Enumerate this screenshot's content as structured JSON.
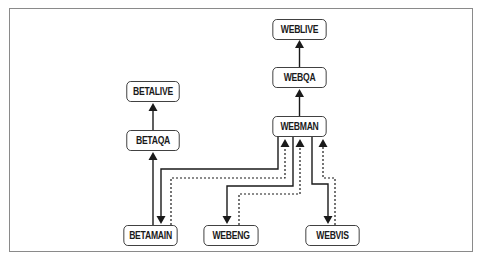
{
  "diagram": {
    "type": "branch-promotion-flow",
    "nodes": {
      "weblive": {
        "label": "WEBLIVE",
        "x": 268,
        "y": 19,
        "w": 63,
        "h": 21
      },
      "webqa": {
        "label": "WEBQA",
        "x": 268,
        "y": 67,
        "w": 63,
        "h": 21
      },
      "webman": {
        "label": "WEBMAN",
        "x": 268,
        "y": 116,
        "w": 63,
        "h": 21
      },
      "betalive": {
        "label": "BETALIVE",
        "x": 122,
        "y": 81,
        "w": 62,
        "h": 21
      },
      "betaqa": {
        "label": "BETAQA",
        "x": 122,
        "y": 130,
        "w": 62,
        "h": 21
      },
      "betamain": {
        "label": "BETAMAIN",
        "x": 119,
        "y": 225,
        "w": 63,
        "h": 21
      },
      "webeng": {
        "label": "WEBENG",
        "x": 199,
        "y": 225,
        "w": 64,
        "h": 21
      },
      "webvis": {
        "label": "WEBVIS",
        "x": 301,
        "y": 225,
        "w": 63,
        "h": 21
      }
    },
    "edges": [
      {
        "from": "WEBQA",
        "to": "WEBLIVE",
        "style": "solid"
      },
      {
        "from": "WEBMAN",
        "to": "WEBQA",
        "style": "solid"
      },
      {
        "from": "BETAQA",
        "to": "BETALIVE",
        "style": "solid"
      },
      {
        "from": "BETAMAIN",
        "to": "BETAQA",
        "style": "solid"
      },
      {
        "from": "WEBMAN",
        "to": "BETAMAIN",
        "style": "solid"
      },
      {
        "from": "BETAMAIN",
        "to": "WEBMAN",
        "style": "dashed"
      },
      {
        "from": "WEBMAN",
        "to": "WEBENG",
        "style": "solid"
      },
      {
        "from": "WEBENG",
        "to": "WEBMAN",
        "style": "dashed"
      },
      {
        "from": "WEBMAN",
        "to": "WEBVIS",
        "style": "solid"
      },
      {
        "from": "WEBVIS",
        "to": "WEBMAN",
        "style": "dashed"
      }
    ],
    "colors": {
      "line": "#1a1a1a",
      "node_border": "#333333",
      "frame_border": "#8a8a8a",
      "background": "#ffffff"
    }
  }
}
